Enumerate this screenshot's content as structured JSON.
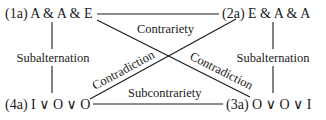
{
  "corners": {
    "top_left": "(1a) A & A & E",
    "top_right": "(2a) E & A & A",
    "bottom_left": "(4a) I ∨ O ∨ O",
    "bottom_right": "(3a) O ∨ O ∨ I"
  },
  "relations": {
    "top": "Contrariety",
    "bottom": "Subcontrariety",
    "left": "Subalternation",
    "right": "Subalternation",
    "diagonal_up": "Contradiction",
    "diagonal_down": "Contradiction"
  },
  "colors": {
    "ink": "#1a1a1a",
    "background": "#ffffff"
  }
}
